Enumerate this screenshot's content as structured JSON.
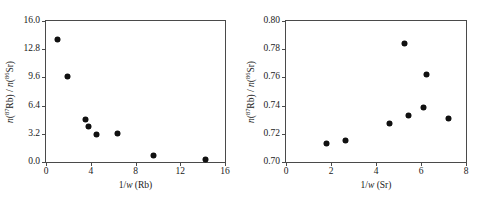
{
  "figure": {
    "background": "#ffffff",
    "marker_color": "#111111",
    "axis_color": "#4a4a4a"
  },
  "chart_data": [
    {
      "type": "scatter",
      "title": "",
      "subtitle": "",
      "panel": "left",
      "xlabel_plain": "1/w (Rb)",
      "xlabel_parts": {
        "prefix": "1/",
        "italic": "w",
        "suffix": " (Rb)"
      },
      "ylabel_plain": "n(87Rb) / n(86Sr)",
      "ylabel_parts": {
        "n1": "n",
        "open1": "(",
        "sup1": "87",
        "el1": "Rb",
        "close1": ")",
        "slash": " / ",
        "n2": "n",
        "open2": "(",
        "sup2": "86",
        "el2": "Sr",
        "close2": ")"
      },
      "xlim": [
        0,
        16
      ],
      "ylim": [
        0.0,
        16.0
      ],
      "xticks": [
        0,
        4,
        8,
        12,
        16
      ],
      "xticklabels": [
        "0",
        "4",
        "8",
        "12",
        "16"
      ],
      "yticks": [
        0.0,
        3.2,
        6.4,
        9.6,
        12.8,
        16.0
      ],
      "yticklabels": [
        "0.0",
        "3.2",
        "6.4",
        "9.6",
        "12.8",
        "16.0"
      ],
      "grid": false,
      "legend": "none",
      "x": [
        1.0,
        1.95,
        3.55,
        3.8,
        4.5,
        6.4,
        9.6,
        14.3
      ],
      "y": [
        13.9,
        9.75,
        4.8,
        4.0,
        3.1,
        3.25,
        0.75,
        0.3
      ]
    },
    {
      "type": "scatter",
      "title": "",
      "subtitle": "",
      "panel": "right",
      "xlabel_plain": "1/w (Sr)",
      "xlabel_parts": {
        "prefix": "1/",
        "italic": "w",
        "suffix": " (Sr)"
      },
      "ylabel_plain": "n(87Rb) / n(86Sr)",
      "ylabel_parts": {
        "n1": "n",
        "open1": "(",
        "sup1": "87",
        "el1": "Rb",
        "close1": ")",
        "slash": " / ",
        "n2": "n",
        "open2": "(",
        "sup2": "86",
        "el2": "Sr",
        "close2": ")"
      },
      "xlim": [
        0,
        8
      ],
      "ylim": [
        0.7,
        0.8
      ],
      "xticks": [
        0,
        2,
        4,
        6,
        8
      ],
      "xticklabels": [
        "0",
        "2",
        "4",
        "6",
        "8"
      ],
      "yticks": [
        0.7,
        0.72,
        0.74,
        0.76,
        0.78,
        0.8
      ],
      "yticklabels": [
        "0.70",
        "0.72",
        "0.74",
        "0.76",
        "0.78",
        "0.80"
      ],
      "grid": false,
      "legend": "none",
      "x": [
        1.8,
        2.65,
        4.6,
        5.25,
        5.45,
        6.1,
        6.25,
        7.2
      ],
      "y": [
        0.7134,
        0.7155,
        0.7273,
        0.7842,
        0.7327,
        0.7386,
        0.7621,
        0.7305
      ]
    }
  ]
}
